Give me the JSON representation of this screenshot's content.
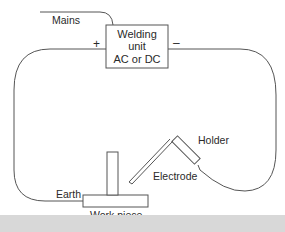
{
  "diagram": {
    "unit": {
      "line1": "Welding",
      "line2": "unit",
      "line3": "AC or DC"
    },
    "labels": {
      "mains": "Mains",
      "plus": "+",
      "minus": "–",
      "holder": "Holder",
      "electrode": "Electrode",
      "earth": "Earth",
      "workpiece": "Work piece"
    },
    "colors": {
      "line": "#555555",
      "text": "#2a2a2a",
      "band": "#d8d8d8"
    }
  }
}
